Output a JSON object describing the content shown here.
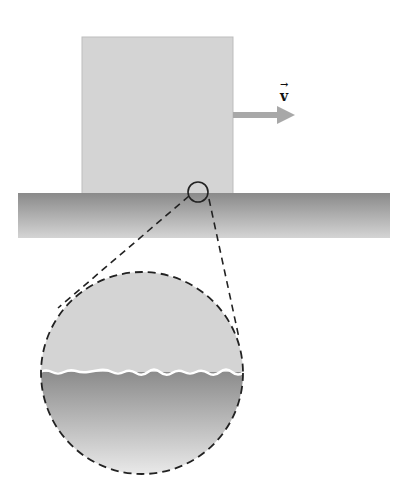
{
  "diagram": {
    "velocity_label": "v",
    "velocity_arrow_symbol": "→",
    "colors": {
      "block": "#d4d4d4",
      "surface_dark": "#8a8a8a",
      "surface_light": "#d2d2d2",
      "arrow": "#a8a8a8",
      "outline": "#222222"
    }
  }
}
